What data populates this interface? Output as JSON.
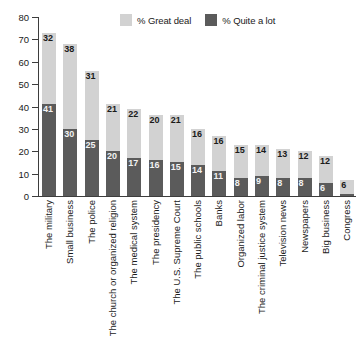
{
  "chart_data": {
    "type": "bar",
    "title": "",
    "subtitle": "",
    "xlabel": "",
    "ylabel": "",
    "ylim": [
      0,
      80
    ],
    "yticks": [
      0,
      10,
      20,
      30,
      40,
      50,
      60,
      70,
      80
    ],
    "grid": false,
    "stacked": true,
    "legend_position": "top-center",
    "categories": [
      "The military",
      "Small business",
      "The police",
      "The church or organized religion",
      "The medical system",
      "The presidency",
      "The U.S. Supreme Court",
      "The public schools",
      "Banks",
      "Organized labor",
      "The criminal justice system",
      "Television news",
      "Newspapers",
      "Big business",
      "Congress"
    ],
    "series": [
      {
        "name": "% Great deal",
        "color": "#d2d2d2",
        "values": [
          32,
          38,
          31,
          21,
          22,
          20,
          21,
          16,
          16,
          15,
          14,
          13,
          12,
          12,
          6
        ]
      },
      {
        "name": "% Quite a lot",
        "color": "#5b5b5b",
        "values": [
          41,
          30,
          25,
          20,
          17,
          16,
          15,
          14,
          11,
          8,
          9,
          8,
          8,
          6,
          1
        ]
      }
    ],
    "totals": [
      73,
      68,
      56,
      41,
      39,
      36,
      36,
      30,
      27,
      23,
      23,
      21,
      20,
      18,
      7
    ],
    "value_labels": {
      "great_deal": [
        "32",
        "38",
        "31",
        "21",
        "22",
        "20",
        "21",
        "16",
        "16",
        "15",
        "14",
        "13",
        "12",
        "12",
        "6"
      ],
      "quite_a_lot": [
        "41",
        "30",
        "25",
        "20",
        "17",
        "16",
        "15",
        "14",
        "11",
        "8",
        "9",
        "8",
        "8",
        "6",
        ""
      ]
    }
  },
  "legend": {
    "items": [
      {
        "label": "% Great deal",
        "color": "#d2d2d2"
      },
      {
        "label": "% Quite a lot",
        "color": "#5b5b5b"
      }
    ]
  },
  "axis": {
    "y_tick_labels": [
      "80",
      "70",
      "60",
      "50",
      "40",
      "30",
      "20",
      "10",
      "0"
    ]
  },
  "colors": {
    "great_deal": "#d2d2d2",
    "quite_a_lot": "#5b5b5b",
    "axis": "#3d3d3d",
    "background": "#ffffff",
    "text": "#1a1a1a"
  }
}
